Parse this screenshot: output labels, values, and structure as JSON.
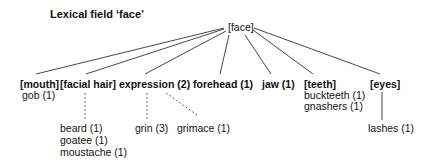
{
  "title": "Lexical field ‘face’",
  "root": {
    "label": "[face]"
  },
  "level1": [
    {
      "id": "mouth",
      "label": "[mouth]",
      "children": [
        "gob (1)"
      ]
    },
    {
      "id": "facial-hair",
      "label": "[facial hair]",
      "children": [
        "beard (1)",
        "goatee (1)",
        "moustache (1)"
      ]
    },
    {
      "id": "expression",
      "label": "expression (2)",
      "children": [
        "grin (3)",
        "grimace (1)"
      ]
    },
    {
      "id": "forehead",
      "label": "forehead (1)",
      "children": []
    },
    {
      "id": "jaw",
      "label": "jaw (1)",
      "children": []
    },
    {
      "id": "teeth",
      "label": "[teeth]",
      "children": [
        "buckteeth (1)",
        "gnashers (1)"
      ]
    },
    {
      "id": "eyes",
      "label": "[eyes]",
      "children": [
        "lashes (1)"
      ]
    }
  ],
  "colors": {
    "line": "#333333",
    "text": "#111111",
    "background": "#ffffff"
  }
}
